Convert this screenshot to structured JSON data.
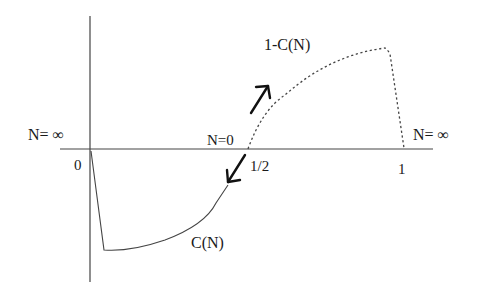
{
  "diagram": {
    "labels": {
      "n_infinity_left": "N= ∞",
      "n_infinity_right": "N= ∞",
      "n_zero": "N=0",
      "origin": "0",
      "half": "1/2",
      "one": "1",
      "curve_upper": "1-C(N)",
      "curve_lower": "C(N)"
    },
    "colors": {
      "line": "#333333",
      "text": "#1a1a1a",
      "background": "#ffffff"
    }
  }
}
